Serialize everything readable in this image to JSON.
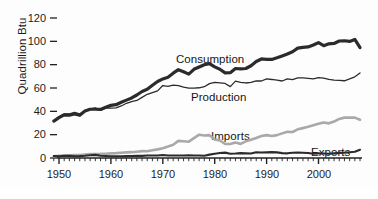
{
  "chart_data": {
    "type": "line",
    "title": "",
    "subtitle": "",
    "xlabel": "",
    "ylabel": "Quadrillion Btu",
    "xlim": [
      1949,
      2008
    ],
    "ylim": [
      0,
      120
    ],
    "grid": false,
    "legend_position": "inline-annotations",
    "y_ticks": [
      0,
      20,
      40,
      60,
      80,
      100,
      120
    ],
    "y_tick_labels": [
      "0",
      "20",
      "40",
      "60",
      "80",
      "100",
      "120"
    ],
    "x_ticks": [
      1950,
      1960,
      1970,
      1980,
      1990,
      2000
    ],
    "x_tick_labels": [
      "1950",
      "1960",
      "1970",
      "1980",
      "1990",
      "2000"
    ],
    "x_minor_tick_interval": 1,
    "x": [
      1949,
      1950,
      1951,
      1952,
      1953,
      1954,
      1955,
      1956,
      1957,
      1958,
      1959,
      1960,
      1961,
      1962,
      1963,
      1964,
      1965,
      1966,
      1967,
      1968,
      1969,
      1970,
      1971,
      1972,
      1973,
      1974,
      1975,
      1976,
      1977,
      1978,
      1979,
      1980,
      1981,
      1982,
      1983,
      1984,
      1985,
      1986,
      1987,
      1988,
      1989,
      1990,
      1991,
      1992,
      1993,
      1994,
      1995,
      1996,
      1997,
      1998,
      1999,
      2000,
      2001,
      2002,
      2003,
      2004,
      2005,
      2006,
      2007,
      2008
    ],
    "series": [
      {
        "name": "Consumption",
        "color": "#2b2b2b",
        "line_width": 3.2,
        "annotation": "Consumption",
        "values": [
          31.6,
          34.6,
          36.9,
          36.7,
          37.7,
          36.6,
          40.2,
          41.8,
          41.8,
          41.6,
          43.5,
          45.1,
          45.7,
          47.8,
          49.6,
          51.5,
          54.0,
          57.0,
          58.9,
          62.4,
          65.6,
          67.8,
          69.3,
          72.7,
          75.7,
          73.9,
          71.9,
          76.0,
          78.0,
          79.9,
          80.9,
          78.1,
          76.1,
          73.0,
          73.1,
          76.7,
          76.4,
          76.7,
          79.1,
          82.7,
          84.9,
          84.6,
          84.5,
          85.9,
          87.5,
          89.2,
          91.1,
          94.2,
          94.8,
          95.2,
          96.8,
          98.9,
          96.3,
          97.9,
          98.2,
          100.3,
          100.5,
          99.9,
          101.6,
          94.6
        ]
      },
      {
        "name": "Production",
        "color": "#2b2b2b",
        "line_width": 1.3,
        "annotation": "Production",
        "values": [
          31.7,
          35.5,
          37.9,
          37.9,
          39.2,
          37.8,
          40.1,
          42.1,
          43.0,
          40.8,
          42.7,
          42.8,
          43.0,
          44.6,
          46.9,
          48.3,
          49.3,
          52.0,
          54.6,
          56.1,
          57.5,
          62.1,
          61.3,
          62.4,
          62.1,
          60.8,
          59.9,
          59.9,
          60.2,
          61.1,
          63.8,
          64.8,
          64.4,
          63.9,
          61.2,
          65.9,
          64.9,
          64.3,
          64.8,
          66.1,
          66.0,
          67.8,
          67.3,
          66.7,
          66.0,
          67.9,
          67.1,
          68.6,
          68.6,
          68.2,
          67.8,
          68.9,
          68.4,
          67.3,
          66.7,
          66.5,
          66.2,
          67.8,
          69.6,
          72.9
        ]
      },
      {
        "name": "Imports",
        "color": "#a9a9a9",
        "line_width": 2.6,
        "annotation": "Imports",
        "values": [
          1.4,
          1.9,
          2.2,
          2.4,
          2.6,
          2.6,
          3.0,
          3.3,
          3.4,
          3.5,
          3.7,
          4.0,
          4.2,
          4.5,
          4.8,
          5.0,
          5.4,
          5.9,
          5.8,
          6.6,
          7.4,
          8.4,
          9.8,
          11.4,
          14.7,
          14.4,
          14.0,
          17.0,
          20.0,
          19.3,
          19.6,
          15.9,
          15.0,
          12.0,
          12.0,
          13.2,
          12.1,
          14.3,
          15.7,
          17.2,
          18.8,
          19.6,
          18.8,
          19.6,
          21.1,
          22.5,
          22.3,
          24.6,
          25.6,
          26.7,
          28.0,
          29.3,
          30.5,
          29.7,
          31.2,
          33.5,
          34.6,
          34.7,
          34.6,
          32.8
        ]
      },
      {
        "name": "Exports",
        "color": "#2b2b2b",
        "line_width": 2.1,
        "annotation": "Exports",
        "values": [
          1.6,
          1.4,
          1.9,
          1.8,
          1.5,
          1.6,
          1.9,
          2.4,
          2.7,
          1.9,
          1.7,
          1.5,
          1.5,
          1.5,
          1.6,
          1.7,
          1.8,
          1.8,
          2.1,
          2.1,
          2.1,
          2.6,
          2.2,
          2.1,
          2.1,
          2.2,
          2.4,
          2.2,
          2.1,
          1.9,
          2.9,
          3.7,
          4.3,
          4.6,
          3.7,
          3.8,
          4.2,
          4.0,
          3.8,
          4.9,
          4.7,
          4.8,
          5.0,
          4.8,
          4.2,
          4.0,
          4.5,
          4.6,
          4.5,
          4.3,
          3.7,
          4.0,
          3.8,
          3.6,
          4.0,
          4.4,
          4.5,
          4.9,
          5.4,
          7.1
        ]
      }
    ]
  },
  "annotations": {
    "consumption": "Consumption",
    "production": "Production",
    "imports": "Imports",
    "exports": "Exports"
  },
  "axis": {
    "y_title": "Quadrillion Btu"
  }
}
